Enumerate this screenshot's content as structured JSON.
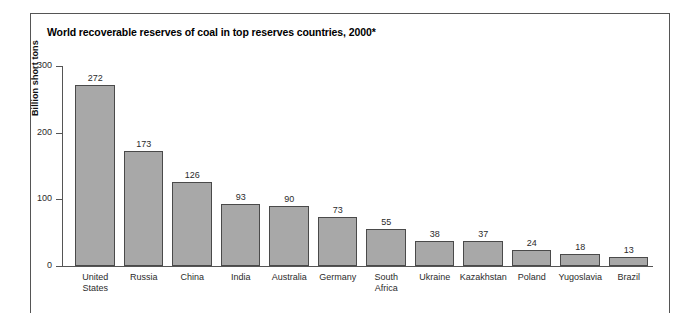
{
  "figure_caption": "",
  "chart_title": "World recoverable reserves of coal in top reserves countries, 2000*",
  "chart_data": {
    "type": "bar",
    "title": "World recoverable reserves of coal in top reserves countries, 2000*",
    "xlabel": "",
    "ylabel": "Billion short tons",
    "ylim": [
      0,
      300
    ],
    "yticks": [
      0,
      100,
      200,
      300
    ],
    "ytick_labels": [
      "0",
      "100",
      "200",
      "300"
    ],
    "grid": false,
    "legend": false,
    "bar_color": "#a8a8a8",
    "bar_border_color": "#4a4a4a",
    "categories": [
      "United States",
      "Russia",
      "China",
      "India",
      "Australia",
      "Germany",
      "South Africa",
      "Ukraine",
      "Kazakhstan",
      "Poland",
      "Yugoslavia",
      "Brazil"
    ],
    "category_lines": [
      [
        "United",
        "States"
      ],
      [
        "Russia"
      ],
      [
        "China"
      ],
      [
        "India"
      ],
      [
        "Australia"
      ],
      [
        "Germany"
      ],
      [
        "South",
        "Africa"
      ],
      [
        "Ukraine"
      ],
      [
        "Kazakhstan"
      ],
      [
        "Poland"
      ],
      [
        "Yugoslavia"
      ],
      [
        "Brazil"
      ]
    ],
    "values": [
      272,
      173,
      126,
      93,
      90,
      73,
      55,
      38,
      37,
      24,
      18,
      13
    ],
    "value_labels": [
      "272",
      "173",
      "126",
      "93",
      "90",
      "73",
      "55",
      "38",
      "37",
      "24",
      "18",
      "13"
    ]
  }
}
